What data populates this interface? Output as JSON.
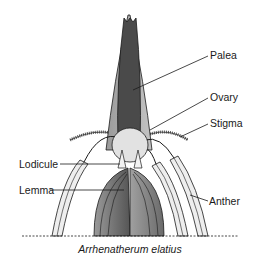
{
  "diagram": {
    "species": "Arrhenatherum elatius",
    "labels": {
      "palea": "Palea",
      "ovary": "Ovary",
      "stigma": "Stigma",
      "lodicule": "Lodicule",
      "lemma": "Lemma",
      "anther": "Anther"
    },
    "colors": {
      "palea_dark": "#4a4a4a",
      "palea_mid": "#8a8a8a",
      "palea_light": "#b8b8b8",
      "ovary": "#e2e2e2",
      "lemma_dark": "#6a6a6a",
      "lemma_light": "#a8a8a8",
      "anther_fill": "#eeeeee",
      "outline": "#1a1a1a"
    }
  }
}
